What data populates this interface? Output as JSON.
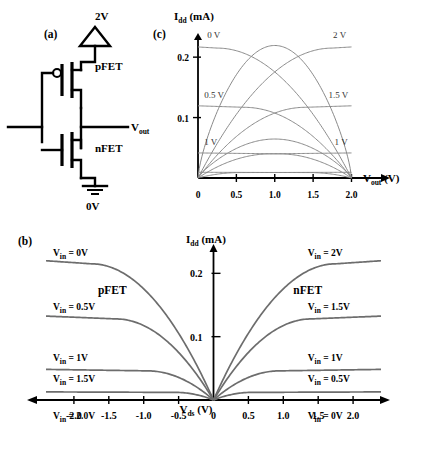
{
  "figure": {
    "panel_a_label": "(a)",
    "panel_b_label": "(b)",
    "panel_c_label": "(c)"
  },
  "circuit": {
    "supply_label": "2V",
    "ground_label": "0V",
    "input_label": "V",
    "input_sub": "in",
    "output_label": "V",
    "output_sub": "out",
    "pfet_label": "pFET",
    "nfet_label": "nFET"
  },
  "chart_data": [
    {
      "id": "panel_b",
      "type": "line",
      "title": "",
      "panel": "(b)",
      "ylabel_main": "I",
      "ylabel_sub": "dd",
      "ylabel_unit": "(mA)",
      "xlabel_main": "V",
      "xlabel_sub": "ds",
      "xlabel_unit": "(V)",
      "xlim": [
        -2.4,
        2.4
      ],
      "ylim": [
        0,
        0.24
      ],
      "xticks": [
        -2.0,
        -1.5,
        -1.0,
        -0.5,
        0,
        0.5,
        1.0,
        1.5,
        2.0
      ],
      "xticklabels": [
        "-2.0",
        "-1.5",
        "-1.0",
        "-0.5",
        "0",
        "0.5",
        "1.0",
        "1.5",
        "2.0"
      ],
      "yticks": [
        0.1,
        0.2
      ],
      "yticklabels": [
        "0.1",
        "0.2"
      ],
      "grid": false,
      "group_labels": [
        {
          "text": "pFET",
          "x": -1.45,
          "y": 0.168
        },
        {
          "text": "nFET",
          "x": 1.35,
          "y": 0.168
        }
      ],
      "series": [
        {
          "name": "V_in = 0V",
          "side": "pfet",
          "label": "V_in = 0V",
          "isat": 0.215,
          "vdsat": -1.75,
          "label_pos": {
            "x": -2.3,
            "y": 0.227
          }
        },
        {
          "name": "V_in = 0.5V",
          "side": "pfet",
          "label": "V_in = 0.5V",
          "isat": 0.128,
          "vdsat": -1.4,
          "label_pos": {
            "x": -2.3,
            "y": 0.142
          }
        },
        {
          "name": "V_in = 1V",
          "side": "pfet",
          "label": "V_in = 1V",
          "isat": 0.046,
          "vdsat": -0.95,
          "label_pos": {
            "x": -2.3,
            "y": 0.062
          }
        },
        {
          "name": "V_in = 1.5V",
          "side": "pfet",
          "label": "V_in = 1.5V",
          "isat": 0.012,
          "vdsat": -0.55,
          "label_pos": {
            "x": -2.3,
            "y": 0.028
          }
        },
        {
          "name": "V_in = 2.0V",
          "side": "pfet",
          "label": "V_in = 2.0V",
          "isat": 0.0,
          "vdsat": 0,
          "label_pos": {
            "x": -2.3,
            "y": -0.03
          }
        },
        {
          "name": "V_in = 2V",
          "side": "nfet",
          "label": "V_in = 2V",
          "isat": 0.215,
          "vdsat": 1.75,
          "label_pos": {
            "x": 1.35,
            "y": 0.227
          }
        },
        {
          "name": "V_in = 1.5V",
          "side": "nfet",
          "label": "V_in = 1.5V",
          "isat": 0.128,
          "vdsat": 1.4,
          "label_pos": {
            "x": 1.35,
            "y": 0.142
          }
        },
        {
          "name": "V_in = 1V",
          "side": "nfet",
          "label": "V_in = 1V",
          "isat": 0.046,
          "vdsat": 0.95,
          "label_pos": {
            "x": 1.35,
            "y": 0.062
          }
        },
        {
          "name": "V_in = 0.5V",
          "side": "nfet",
          "label": "V_in = 0.5V",
          "isat": 0.012,
          "vdsat": 0.55,
          "label_pos": {
            "x": 1.35,
            "y": 0.028
          }
        },
        {
          "name": "V_in = 0V",
          "side": "nfet",
          "label": "V_in = 0V",
          "isat": 0.0,
          "vdsat": 0,
          "label_pos": {
            "x": 1.35,
            "y": -0.03
          }
        }
      ]
    },
    {
      "id": "panel_c",
      "type": "line",
      "panel": "(c)",
      "ylabel_main": "I",
      "ylabel_sub": "dd",
      "ylabel_unit": "(mA)",
      "xlabel_main": "V",
      "xlabel_sub": "out",
      "xlabel_unit": "(V)",
      "xlim": [
        0,
        2.15
      ],
      "ylim": [
        0,
        0.235
      ],
      "xticks": [
        0,
        0.5,
        1.0,
        1.5,
        2.0
      ],
      "xticklabels": [
        "0",
        "0.5",
        "1.0",
        "1.5",
        "2.0"
      ],
      "yticks": [
        0.1,
        0.2
      ],
      "yticklabels": [
        "0.1",
        "0.2"
      ],
      "grid": false,
      "series": [
        {
          "name": "pFET 0 V",
          "family": "pfet",
          "label": "0 V",
          "isat": 0.215,
          "vdsat": 1.75,
          "label_pos": {
            "x": 0.12,
            "y": 0.232
          }
        },
        {
          "name": "pFET 0.5 V",
          "family": "pfet",
          "label": "0.5 V",
          "isat": 0.117,
          "vdsat": 1.4,
          "label_pos": {
            "x": 0.08,
            "y": 0.133
          }
        },
        {
          "name": "pFET 1 V",
          "family": "pfet",
          "label": "1 V",
          "isat": 0.04,
          "vdsat": 0.95,
          "label_pos": {
            "x": 0.08,
            "y": 0.055
          }
        },
        {
          "name": "pFET 1.5 V",
          "family": "pfet",
          "label": "",
          "isat": 0.009,
          "vdsat": 0.55,
          "label_pos": null
        },
        {
          "name": "nFET 2 V",
          "family": "nfet",
          "label": "2 V",
          "isat": 0.215,
          "vdsat": 1.75,
          "label_pos": {
            "x": 1.76,
            "y": 0.232
          }
        },
        {
          "name": "nFET 1.5 V",
          "family": "nfet",
          "label": "1.5 V",
          "isat": 0.117,
          "vdsat": 1.4,
          "label_pos": {
            "x": 1.7,
            "y": 0.133
          }
        },
        {
          "name": "nFET 1 V",
          "family": "nfet",
          "label": "1 V",
          "isat": 0.04,
          "vdsat": 0.95,
          "label_pos": {
            "x": 1.78,
            "y": 0.055
          }
        },
        {
          "name": "nFET 0.5 V",
          "family": "nfet",
          "label": "",
          "isat": 0.009,
          "vdsat": 0.55,
          "label_pos": null
        },
        {
          "name": "crossing-pfet-load",
          "family": "pfet-arc",
          "label": "",
          "isat": 0.215,
          "vdsat": 1.0,
          "label_pos": null
        },
        {
          "name": "crossing-nfet-load",
          "family": "nfet-arc",
          "label": "",
          "isat": 0.215,
          "vdsat": 1.0,
          "label_pos": null
        }
      ]
    }
  ],
  "colors": {
    "curve_c": "#8a8a8a",
    "curve_b": "#6d6d6d",
    "axis": "#000000",
    "text": "#000000"
  }
}
